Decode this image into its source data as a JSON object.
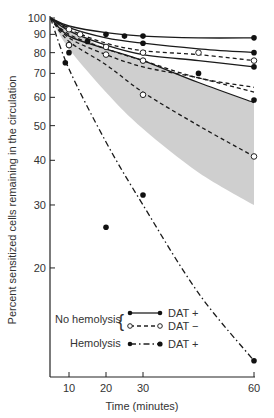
{
  "chart_data": {
    "type": "line",
    "title": "",
    "xlabel": "Time (minutes)",
    "ylabel": "Percent sensitized cells remaining in the circulation",
    "yscale": "log",
    "ylim": [
      10,
      100
    ],
    "xlim": [
      5,
      60
    ],
    "grid": false,
    "x_ticks": [
      10,
      20,
      30,
      60
    ],
    "y_ticks": [
      100,
      90,
      80,
      70,
      60,
      50,
      40,
      30,
      20
    ],
    "legend": {
      "position": "lower-left inside",
      "groups": [
        {
          "label": "No hemolysis",
          "entries": [
            {
              "marker": "filled",
              "line": "solid",
              "label": "DAT +"
            },
            {
              "marker": "open",
              "line": "dashed",
              "label": "DAT −"
            }
          ]
        },
        {
          "label": "Hemolysis",
          "entries": [
            {
              "marker": "filled",
              "line": "dash-dot",
              "label": "DAT +"
            }
          ]
        }
      ]
    },
    "shaded_band": {
      "description": "grey envelope",
      "upper": [
        [
          5,
          100
        ],
        [
          20,
          82
        ],
        [
          30,
          76
        ],
        [
          45,
          66
        ],
        [
          60,
          58
        ]
      ],
      "lower": [
        [
          5,
          100
        ],
        [
          10,
          82
        ],
        [
          20,
          62
        ],
        [
          30,
          49
        ],
        [
          45,
          37
        ],
        [
          60,
          30
        ]
      ]
    },
    "series": [
      {
        "name": "No hemolysis DAT+ (a)",
        "style": "solid",
        "marker": "filled",
        "curve": [
          [
            5,
            100
          ],
          [
            10,
            95
          ],
          [
            20,
            91
          ],
          [
            30,
            89
          ],
          [
            45,
            88
          ],
          [
            60,
            88
          ]
        ],
        "points": [
          [
            25,
            89
          ],
          [
            30,
            89
          ],
          [
            60,
            88
          ]
        ]
      },
      {
        "name": "No hemolysis DAT+ (b)",
        "style": "solid",
        "marker": "filled",
        "curve": [
          [
            5,
            100
          ],
          [
            10,
            94
          ],
          [
            20,
            88
          ],
          [
            30,
            85
          ],
          [
            45,
            82
          ],
          [
            60,
            80
          ]
        ],
        "points": [
          [
            20,
            90
          ],
          [
            30,
            85
          ],
          [
            60,
            80
          ]
        ]
      },
      {
        "name": "No hemolysis DAT− (a)",
        "style": "dashed",
        "marker": "open",
        "curve": [
          [
            5,
            100
          ],
          [
            10,
            93
          ],
          [
            20,
            85
          ],
          [
            30,
            81
          ],
          [
            45,
            79
          ],
          [
            60,
            76
          ]
        ],
        "points": [
          [
            10,
            93
          ],
          [
            13,
            90
          ],
          [
            30,
            80
          ],
          [
            45,
            80
          ],
          [
            60,
            76
          ]
        ]
      },
      {
        "name": "No hemolysis DAT+ (c)",
        "style": "solid",
        "marker": "filled",
        "curve": [
          [
            5,
            100
          ],
          [
            10,
            92
          ],
          [
            20,
            84
          ],
          [
            30,
            79
          ],
          [
            45,
            76
          ],
          [
            60,
            73
          ]
        ],
        "points": [
          [
            15,
            86
          ],
          [
            30,
            76
          ],
          [
            60,
            73
          ]
        ]
      },
      {
        "name": "No hemolysis DAT− (b)",
        "style": "dashed",
        "marker": "open",
        "curve": [
          [
            5,
            100
          ],
          [
            10,
            90
          ],
          [
            20,
            82
          ],
          [
            30,
            76
          ],
          [
            45,
            68
          ],
          [
            60,
            64
          ]
        ],
        "points": [
          [
            10,
            84
          ],
          [
            20,
            83
          ],
          [
            30,
            76
          ]
        ]
      },
      {
        "name": "No hemolysis DAT− (c)",
        "style": "dashed",
        "marker": "open",
        "curve": [
          [
            5,
            100
          ],
          [
            10,
            88
          ],
          [
            20,
            79
          ],
          [
            30,
            73
          ],
          [
            45,
            68
          ],
          [
            60,
            62
          ]
        ],
        "points": [
          [
            20,
            79
          ]
        ]
      },
      {
        "name": "No hemolysis DAT+ (d)",
        "style": "solid",
        "marker": "filled",
        "curve": [
          [
            5,
            100
          ],
          [
            10,
            89
          ],
          [
            20,
            82
          ],
          [
            30,
            76
          ],
          [
            45,
            66
          ],
          [
            60,
            58
          ]
        ],
        "points": [
          [
            10,
            80
          ],
          [
            45,
            70
          ],
          [
            60,
            59
          ]
        ]
      },
      {
        "name": "No hemolysis DAT− (d)",
        "style": "dashed",
        "marker": "open",
        "curve": [
          [
            5,
            100
          ],
          [
            10,
            86
          ],
          [
            20,
            74
          ],
          [
            30,
            62
          ],
          [
            45,
            50
          ],
          [
            60,
            41
          ]
        ],
        "points": [
          [
            10,
            84
          ],
          [
            30,
            61
          ],
          [
            60,
            41
          ]
        ]
      },
      {
        "name": "Hemolysis DAT+",
        "style": "dash-dot",
        "marker": "filled",
        "curve": [
          [
            5,
            100
          ],
          [
            10,
            72
          ],
          [
            20,
            45
          ],
          [
            30,
            30
          ],
          [
            45,
            17
          ],
          [
            60,
            11
          ]
        ],
        "points": [
          [
            9,
            75
          ],
          [
            20,
            26
          ],
          [
            30,
            32
          ],
          [
            60,
            11
          ]
        ]
      }
    ]
  },
  "axes": {
    "x_title": "Time (minutes)",
    "y_title": "Percent sensitized cells remaining in the circulation",
    "x_tick_labels": [
      "10",
      "20",
      "30",
      "60"
    ],
    "y_tick_labels": [
      "100",
      "90",
      "80",
      "70",
      "60",
      "50",
      "40",
      "30",
      "20"
    ]
  },
  "legend": {
    "no_hemolysis": "No hemolysis",
    "hemolysis": "Hemolysis",
    "brace": "{",
    "dat_pos_1": "DAT +",
    "dat_neg": "DAT −",
    "dat_pos_2": "DAT +"
  }
}
